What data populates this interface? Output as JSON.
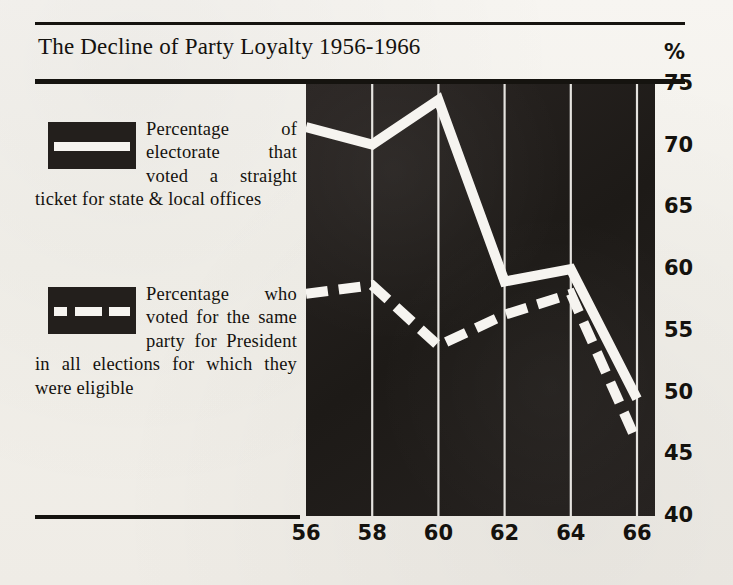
{
  "title": "The Decline of Party Loyalty 1956-1966",
  "percent_symbol": "%",
  "legend": {
    "solid": {
      "swatch_icon": "solid-line-swatch",
      "text": "Percentage of electorate that voted a straight ticket for state & local offices"
    },
    "dashed": {
      "swatch_icon": "dashed-line-swatch",
      "text": "Percentage who voted for the same party for President in all elections for which they were eligible"
    }
  },
  "colors": {
    "ink": "#231f1c",
    "paper": "#f4f2ee",
    "line": "#f6f4f0",
    "text": "#14120e"
  },
  "chart_data": {
    "type": "line",
    "title": "The Decline of Party Loyalty 1956-1966",
    "xlabel": "",
    "ylabel": "%",
    "ylim": [
      40,
      75
    ],
    "xlim": [
      1956,
      1966
    ],
    "yticks": [
      75,
      70,
      65,
      60,
      55,
      50,
      45,
      40
    ],
    "xticks": [
      56,
      58,
      60,
      62,
      64,
      66
    ],
    "xtick_years": [
      1956,
      1958,
      1960,
      1962,
      1964,
      1966
    ],
    "grid": "vertical",
    "legend_position": "left-outside",
    "background": "dark",
    "x": [
      1956,
      1958,
      1960,
      1962,
      1964,
      1966
    ],
    "series": [
      {
        "name": "Percentage of electorate that voted a straight ticket for state & local offices",
        "style": "solid",
        "values": [
          71.5,
          70.1,
          73.7,
          59.0,
          60.0,
          49.5
        ]
      },
      {
        "name": "Percentage who voted for the same party for President in all elections for which they were eligible",
        "style": "dashed",
        "values": [
          58.0,
          58.7,
          53.8,
          56.3,
          58.0,
          46.0
        ]
      }
    ]
  }
}
